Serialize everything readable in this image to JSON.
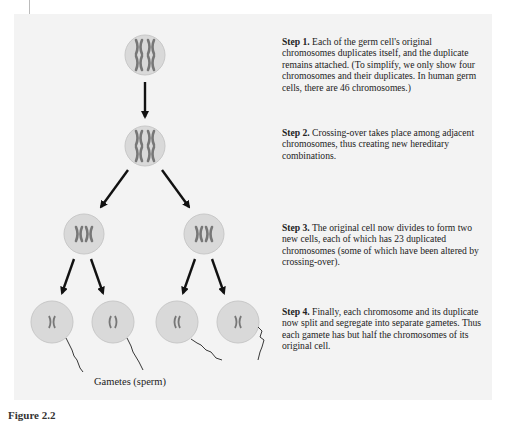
{
  "figure": {
    "caption_partial": "Figure 2.2",
    "bottom_label": "Gametes (sperm)",
    "colors": {
      "panel_bg": "#f3f3f3",
      "cell_fill": "#d9d9d9",
      "cell_stroke": "#c4c4c4",
      "chromosome": "#7a7a7a",
      "arrow": "#111111",
      "text": "#222222"
    }
  },
  "steps": [
    {
      "label": "Step 1.",
      "text": " Each of the germ cell's original chromosomes duplicates itself, and the duplicate remains attached.  (To simplify, we only show four chromosomes and their duplicates. In human germ cells, there are 46 chromosomes.)"
    },
    {
      "label": "Step 2.",
      "text": " Crossing-over takes place among adjacent chromosomes, thus creating new hereditary combinations."
    },
    {
      "label": "Step 3.",
      "text": " The original cell now divides to form two new cells, each of which has 23 duplicated chromosomes (some of which have been altered by crossing-over)."
    },
    {
      "label": "Step 4.",
      "text": " Finally, each chromosome and its duplicate now split and segregate into separate gametes. Thus each gamete has but half the chromosomes of its original cell."
    }
  ],
  "cells": [
    {
      "id": "germ-cell",
      "stage": 1,
      "chromosomes": "4 duplicated (XX/XX)"
    },
    {
      "id": "crossover-cell",
      "stage": 2,
      "chromosomes": "4 duplicated with crossing-over"
    },
    {
      "id": "daughter-cell-left",
      "stage": 3,
      "chromosomes": "2 duplicated"
    },
    {
      "id": "daughter-cell-right",
      "stage": 3,
      "chromosomes": "2 duplicated"
    },
    {
      "id": "gamete-1",
      "stage": 4
    },
    {
      "id": "gamete-2",
      "stage": 4
    },
    {
      "id": "gamete-3",
      "stage": 4
    },
    {
      "id": "gamete-4",
      "stage": 4
    }
  ]
}
